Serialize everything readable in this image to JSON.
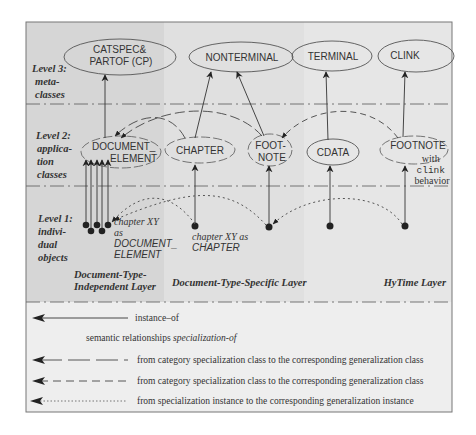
{
  "levels": [
    {
      "line1": "Level 3:",
      "line2": "meta-",
      "line3": "classes"
    },
    {
      "line1": "Level 2:",
      "line2": "applica-",
      "line3": "tion",
      "line4": "classes"
    },
    {
      "line1": "Level 1:",
      "line2": "indivi-",
      "line3": "dual",
      "line4": "objects"
    }
  ],
  "metaclasses": [
    {
      "line1": "CATSPEC&",
      "line2": "PARTOF (CP)"
    },
    {
      "line1": "NONTERMINAL"
    },
    {
      "line1": "TERMINAL"
    },
    {
      "line1": "CLINK"
    }
  ],
  "app_classes": [
    {
      "line1": "DOCUMENT_",
      "line2": "ELEMENT"
    },
    {
      "line1": "CHAPTER"
    },
    {
      "line1": "FOOT-",
      "line2": "NOTE"
    },
    {
      "line1": "CDATA"
    },
    {
      "line1": "FOOTNOTE"
    }
  ],
  "footnote_note": {
    "line1": "with",
    "line2": "clink",
    "line3": "behavior"
  },
  "objects": {
    "doc_element_label": {
      "line1": "chapter XY",
      "line2": "as",
      "line3": "DOCUMENT_",
      "line4": "ELEMENT"
    },
    "chapter_label": {
      "line1": "chapter XY as",
      "line2": "CHAPTER"
    }
  },
  "layers": [
    {
      "line1": "Document-Type-",
      "line2": "Independent Layer"
    },
    {
      "line1": "Document-Type-Specific Layer"
    },
    {
      "line1": "HyTime Layer"
    }
  ],
  "legend": {
    "instance_of": "instance–of",
    "heading_prefix": "semantic relationships ",
    "heading_italic": "specialization-of",
    "items": [
      {
        "style": "long-dash",
        "label": "from category specialization class to the corresponding generalization class"
      },
      {
        "style": "dash",
        "label": "from category specialization class to the corresponding generalization class"
      },
      {
        "style": "dotted",
        "label": "from specialization instance to the corresponding generalization instance"
      }
    ]
  },
  "colors": {
    "panel_left": "#d6d6d6",
    "panel_mid": "#e0e0e0",
    "panel_right": "#e6e6e6",
    "legend_bg": "#eeeeee",
    "ink": "#222222"
  }
}
